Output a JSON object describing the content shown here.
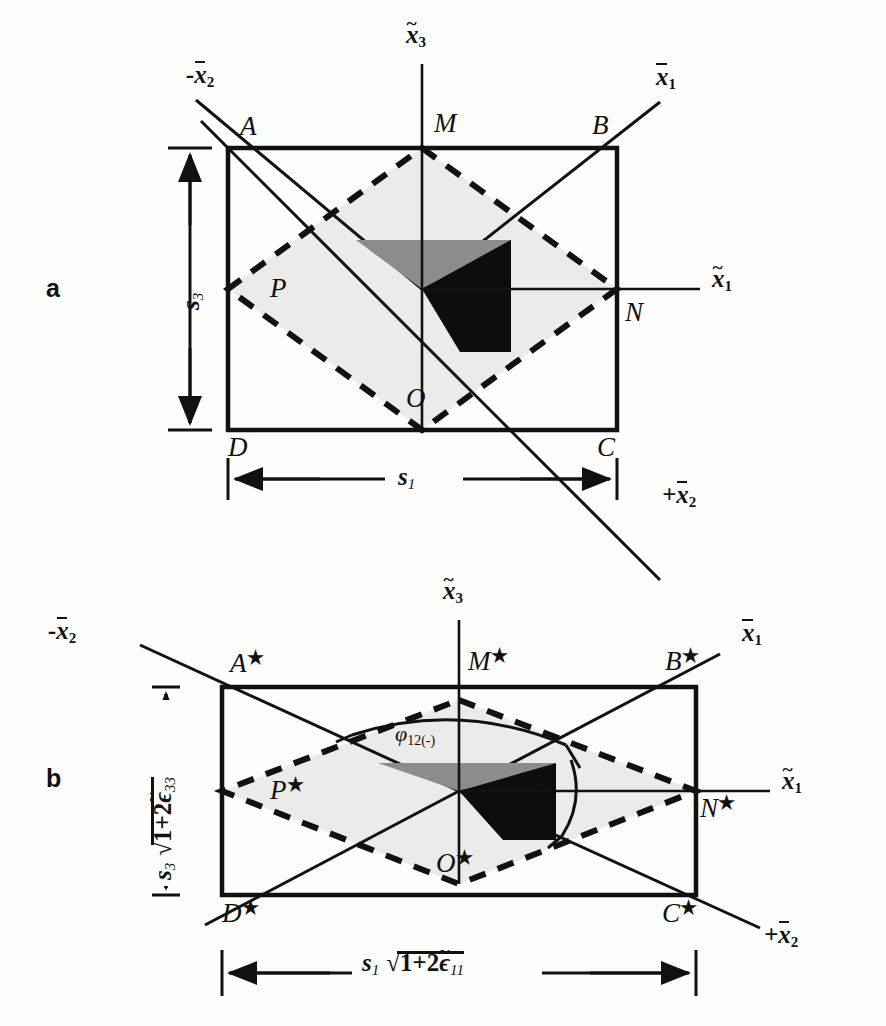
{
  "figure": {
    "type": "technical-diagram",
    "panels": [
      {
        "id": "a",
        "letter": "a",
        "axes": {
          "vertical": "x̃₃",
          "right_diag": "x̄₁",
          "left_diag": "-x̄₂",
          "lower_right_diag": "+x̄₂",
          "horizontal_right": "x̃₁"
        },
        "corners": [
          "A",
          "B",
          "C",
          "D"
        ],
        "midpoints": [
          "M",
          "N",
          "O",
          "P"
        ],
        "dim_vertical": "s₃",
        "dim_horizontal": "s₁"
      },
      {
        "id": "b",
        "letter": "b",
        "axes": {
          "vertical": "x̃₃",
          "right_diag": "x̄₁",
          "left_diag": "-x̄₂",
          "lower_right_diag": "+x̄₂",
          "horizontal_right": "x̃₁"
        },
        "corners": [
          "A★",
          "B★",
          "C★",
          "D★"
        ],
        "midpoints": [
          "M★",
          "N★",
          "O★",
          "P★"
        ],
        "dim_vertical": "s₃√(1+2ε̃₃₃)",
        "dim_horizontal": "s₁√(1+2ε̃₁₁)",
        "angles": [
          "φ₁₂₍₋₎",
          "φ₁₂"
        ]
      }
    ],
    "labels": {
      "panel_a_letter": "a",
      "panel_b_letter": "b",
      "A": "A",
      "B": "B",
      "C": "C",
      "D": "D",
      "M": "M",
      "N": "N",
      "O": "O",
      "P": "P",
      "A_star_base": "A",
      "B_star_base": "B",
      "C_star_base": "C",
      "D_star_base": "D",
      "M_star_base": "M",
      "N_star_base": "N",
      "O_star_base": "O",
      "P_star_base": "P",
      "star_glyph": "★",
      "x_base": "x",
      "sub_1": "1",
      "sub_2": "2",
      "sub_3": "3",
      "sub_11": "11",
      "sub_33": "33",
      "sub_12": "12",
      "sub_12_minus": "12(-)",
      "minus_sign": "-",
      "plus_sign": "+",
      "s_base": "s",
      "phi": "φ",
      "sqrt_glyph": "√",
      "one_plus_two": "1+2",
      "epsilon_tilde": "ϵ"
    },
    "colors": {
      "stroke": "#111111",
      "light_fill": "#ebebe9",
      "gray_triangle": "#8c8c8c",
      "black_triangle": "#0d0d0d",
      "background": "#fdfdfb"
    }
  }
}
